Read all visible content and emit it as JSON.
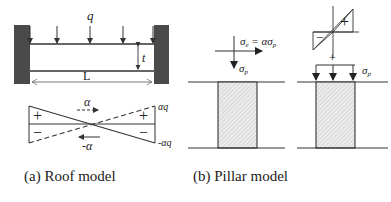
{
  "roof_model": {
    "caption": "(a) Roof model",
    "load_label": "q",
    "length_label": "L",
    "thickness_label": "t",
    "moment_diagram": {
      "plus_left": "+",
      "minus_left": "−",
      "plus_right": "+",
      "minus_right": "−",
      "alpha_label": "α",
      "neg_alpha_label": "-α",
      "alpha_q_label": "αq",
      "neg_alpha_q_label": "-αq"
    }
  },
  "pillar_model": {
    "caption": "(b) Pillar model",
    "equation_lhs": "σ",
    "equation_lhs_sub": "e",
    "equation_mid": " = ασ",
    "equation_rhs_sub": "p",
    "sigma_p_label": "σ",
    "sigma_p_sub": "p",
    "stress_plus": "+",
    "stress_minus": "−",
    "plus_between": "+",
    "sigma_p_right_label": "σ",
    "sigma_p_right_sub": "p"
  },
  "colors": {
    "line": "#333333",
    "wall": "#4a4a4a",
    "hatch": "#bbbbbb",
    "pillar_fill": "#e6e6e6"
  }
}
